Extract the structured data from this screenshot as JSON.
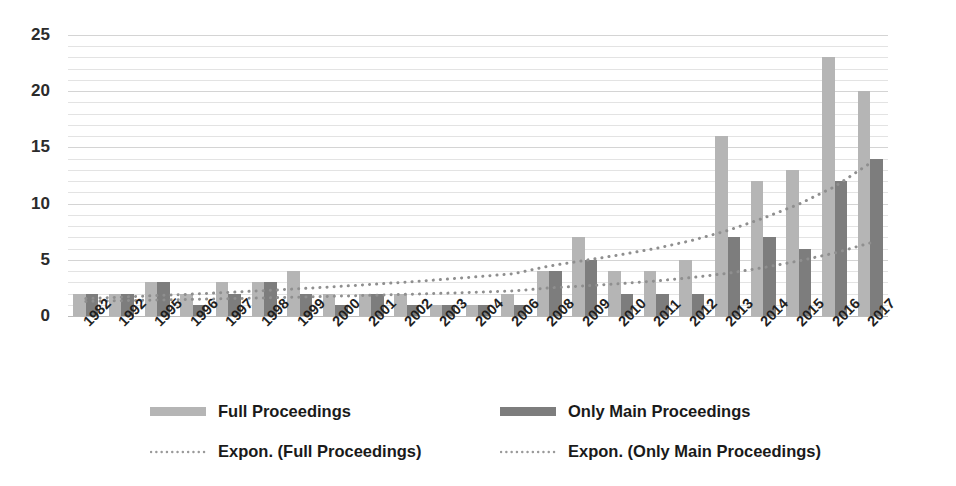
{
  "chart_data": {
    "type": "bar",
    "title": "",
    "xlabel": "",
    "ylabel": "",
    "ylim": [
      0,
      25
    ],
    "y_ticks": [
      0,
      5,
      10,
      15,
      20,
      25
    ],
    "grid": true,
    "grid_minor_step": 1,
    "legend_position": "bottom",
    "categories": [
      "1982",
      "1992",
      "1995",
      "1996",
      "1997",
      "1998",
      "1999",
      "2000",
      "2001",
      "2002",
      "2003",
      "2004",
      "2006",
      "2008",
      "2009",
      "2010",
      "2011",
      "2012",
      "2013",
      "2014",
      "2015",
      "2016",
      "2017"
    ],
    "series": [
      {
        "name": "Full Proceedings",
        "type": "bar",
        "color": "#b5b5b5",
        "values": [
          2,
          2,
          3,
          2,
          3,
          3,
          4,
          2,
          2,
          2,
          1,
          1,
          2,
          4,
          7,
          4,
          4,
          5,
          16,
          12,
          13,
          23,
          20
        ]
      },
      {
        "name": "Only Main Proceedings",
        "type": "bar",
        "color": "#7d7d7d",
        "values": [
          2,
          2,
          3,
          1,
          2,
          3,
          2,
          1,
          2,
          1,
          1,
          1,
          1,
          4,
          5,
          2,
          2,
          2,
          7,
          7,
          6,
          12,
          14
        ]
      },
      {
        "name": "Expon. (Full Proceedings)",
        "type": "trendline",
        "style": "dotted",
        "color": "#8f8f8f",
        "values": [
          1.55,
          1.68,
          1.82,
          1.95,
          2.1,
          2.26,
          2.43,
          2.61,
          2.81,
          3.02,
          3.25,
          3.5,
          3.76,
          4.45,
          4.95,
          5.45,
          6.02,
          6.72,
          7.6,
          8.7,
          9.95,
          11.5,
          13.6
        ]
      },
      {
        "name": "Expon. (Only Main Proceedings)",
        "type": "trendline",
        "style": "dotted",
        "color": "#8f8f8f",
        "values": [
          1.3,
          1.36,
          1.42,
          1.48,
          1.54,
          1.61,
          1.68,
          1.76,
          1.84,
          1.93,
          2.02,
          2.12,
          2.23,
          2.5,
          2.68,
          2.88,
          3.12,
          3.42,
          3.8,
          4.3,
          4.9,
          5.6,
          6.5
        ]
      }
    ]
  },
  "legend": {
    "items": [
      {
        "label": "Full Proceedings",
        "marker": "swatch-light"
      },
      {
        "label": "Only Main Proceedings",
        "marker": "swatch-dark"
      },
      {
        "label": "Expon. (Full Proceedings)",
        "marker": "dotted-line"
      },
      {
        "label": "Expon. (Only Main Proceedings)",
        "marker": "dotted-line"
      }
    ]
  },
  "colors": {
    "full_proceedings": "#b5b5b5",
    "only_main_proceedings": "#7d7d7d",
    "trendline": "#8f8f8f",
    "gridline": "#e3e3e3",
    "text": "#1a1a1a",
    "background": "#ffffff"
  }
}
